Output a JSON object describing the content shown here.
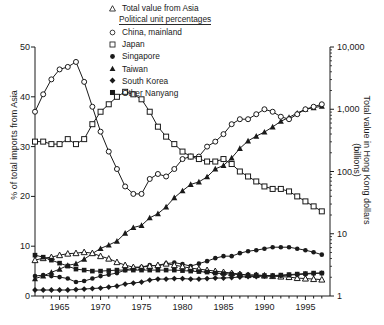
{
  "chart_data": {
    "type": "line",
    "title": "",
    "xlabel": "",
    "ylabel": "% of total imports from Asia",
    "ylabel_right": "Total value in Hong Kong dollars (billions)",
    "xlim": [
      1962,
      1998
    ],
    "ylim": [
      0,
      50
    ],
    "ylim_right": [
      1,
      10000
    ],
    "yscale_right": "log",
    "grid": false,
    "legend_position": "top-right",
    "legend_header": "Political unit percentages",
    "xticks": [
      1965,
      1970,
      1975,
      1980,
      1985,
      1990,
      1995
    ],
    "xtick_labels": [
      "1965",
      "1970",
      "1975",
      "1980",
      "1985",
      "1990",
      "1995"
    ],
    "xticks_minor_step": 1,
    "yticks_left": [
      0,
      10,
      20,
      30,
      40,
      50
    ],
    "ytick_labels_left": [
      "0",
      "10",
      "20",
      "30",
      "40",
      "50"
    ],
    "yticks_right": [
      1,
      10,
      100,
      1000,
      10000
    ],
    "ytick_labels_right": [
      "1",
      "10",
      "100",
      "1,000",
      "10,000"
    ],
    "x": [
      1962,
      1963,
      1964,
      1965,
      1966,
      1967,
      1968,
      1969,
      1970,
      1971,
      1972,
      1973,
      1974,
      1975,
      1976,
      1977,
      1978,
      1979,
      1980,
      1981,
      1982,
      1983,
      1984,
      1985,
      1986,
      1987,
      1988,
      1989,
      1990,
      1991,
      1992,
      1993,
      1994,
      1995,
      1996,
      1997
    ],
    "series": [
      {
        "name": "Total value from Asia",
        "marker": "triangle-up-filled",
        "axis": "right",
        "unit": "HK$ billions",
        "values": [
          1.9,
          2.1,
          2.4,
          2.7,
          3.1,
          3.3,
          3.9,
          4.8,
          5.8,
          6.6,
          7.6,
          10.2,
          12.6,
          13.6,
          18.0,
          21.0,
          27.0,
          38.0,
          49.0,
          62.0,
          68.0,
          82.0,
          110.0,
          125.0,
          165.0,
          235.0,
          310.0,
          370.0,
          430.0,
          520.0,
          640.0,
          740.0,
          870.0,
          1000.0,
          1060.0,
          1120.0
        ]
      },
      {
        "name": "China, mainland",
        "marker": "circle-open",
        "axis": "left",
        "unit": "%",
        "values": [
          37.0,
          40.5,
          43.5,
          45.5,
          46.0,
          47.0,
          43.0,
          38.0,
          33.0,
          29.0,
          25.5,
          22.0,
          20.5,
          20.5,
          23.5,
          24.5,
          24.0,
          25.5,
          27.5,
          28.0,
          28.0,
          30.0,
          31.0,
          32.5,
          34.5,
          35.5,
          35.5,
          36.5,
          37.5,
          37.0,
          36.0,
          35.5,
          36.5,
          37.5,
          38.0,
          38.5
        ]
      },
      {
        "name": "Japan",
        "marker": "square-open",
        "axis": "left",
        "unit": "%",
        "values": [
          31.0,
          31.0,
          30.5,
          30.5,
          31.5,
          30.5,
          31.5,
          34.5,
          37.0,
          38.5,
          40.0,
          41.0,
          40.5,
          39.5,
          37.0,
          34.0,
          32.0,
          30.5,
          29.0,
          28.0,
          27.5,
          27.0,
          27.0,
          27.5,
          26.5,
          25.0,
          24.0,
          23.0,
          22.0,
          21.5,
          21.5,
          21.0,
          20.0,
          19.0,
          18.0,
          17.0
        ]
      },
      {
        "name": "Singapore",
        "marker": "circle-filled",
        "axis": "left",
        "unit": "%",
        "values": [
          4.0,
          4.2,
          4.0,
          3.8,
          3.5,
          2.8,
          3.0,
          3.5,
          4.0,
          4.3,
          4.6,
          5.2,
          5.6,
          5.8,
          6.2,
          6.0,
          6.5,
          6.7,
          6.4,
          6.0,
          6.5,
          7.0,
          7.6,
          8.0,
          8.0,
          8.6,
          9.0,
          9.2,
          9.5,
          9.8,
          9.8,
          9.8,
          9.5,
          9.2,
          8.8,
          8.3
        ]
      },
      {
        "name": "Taiwan",
        "marker": "triangle-up-open",
        "axis": "left",
        "unit": "%",
        "values": [
          7.2,
          7.6,
          7.8,
          8.2,
          8.5,
          8.6,
          8.8,
          8.6,
          8.0,
          7.5,
          6.8,
          6.2,
          5.8,
          5.8,
          6.0,
          6.2,
          6.5,
          6.2,
          5.9,
          5.6,
          5.4,
          5.2,
          5.0,
          4.8,
          4.6,
          4.4,
          4.2,
          4.2,
          4.1,
          4.0,
          3.9,
          3.8,
          3.6,
          3.5,
          3.4,
          3.3
        ]
      },
      {
        "name": "South Korea",
        "marker": "diamond-filled",
        "axis": "left",
        "unit": "%",
        "values": [
          1.2,
          1.2,
          1.2,
          1.2,
          1.2,
          1.3,
          1.4,
          1.5,
          1.6,
          1.8,
          2.0,
          2.4,
          2.6,
          2.8,
          3.2,
          3.4,
          3.4,
          3.5,
          3.5,
          3.4,
          3.4,
          3.5,
          3.6,
          3.6,
          3.7,
          3.8,
          3.9,
          3.9,
          4.0,
          4.0,
          4.1,
          4.2,
          4.3,
          4.4,
          4.5,
          4.6
        ]
      },
      {
        "name": "Other Nanyang",
        "marker": "square-filled",
        "axis": "left",
        "unit": "%",
        "values": [
          8.2,
          7.8,
          7.2,
          6.6,
          6.0,
          5.4,
          5.2,
          5.0,
          5.0,
          5.1,
          5.2,
          5.2,
          5.2,
          5.2,
          5.2,
          5.2,
          5.2,
          5.2,
          5.1,
          5.0,
          4.9,
          4.8,
          4.6,
          4.5,
          4.4,
          4.3,
          4.2,
          4.2,
          4.1,
          4.1,
          4.2,
          4.3,
          4.4,
          4.5,
          4.6,
          4.6
        ]
      }
    ]
  },
  "legend": {
    "total_label": "Total value from Asia",
    "header": "Political unit percentages",
    "items": [
      {
        "label": "China, mainland"
      },
      {
        "label": "Japan"
      },
      {
        "label": "Singapore"
      },
      {
        "label": "Taiwan"
      },
      {
        "label": "South Korea"
      },
      {
        "label": "Other Nanyang"
      }
    ]
  }
}
